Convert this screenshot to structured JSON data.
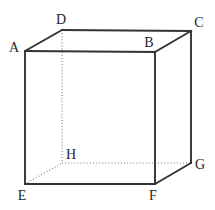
{
  "figure": {
    "name": "cube-diagram",
    "shape": "cube",
    "background_color": "#ffffff",
    "solid_edge_color": "#333333",
    "hidden_edge_color": "#7a7a7a",
    "label_color": "#262626",
    "vertices": [
      {
        "id": "A",
        "label": "A",
        "point": {
          "x": 25,
          "y": 51
        },
        "label_pos": {
          "x": 14,
          "y": 48
        },
        "hidden": false
      },
      {
        "id": "B",
        "label": "B",
        "point": {
          "x": 155,
          "y": 52
        },
        "label_pos": {
          "x": 149,
          "y": 43
        },
        "hidden": false
      },
      {
        "id": "C",
        "label": "C",
        "point": {
          "x": 191,
          "y": 31
        },
        "label_pos": {
          "x": 199,
          "y": 23
        },
        "hidden": false
      },
      {
        "id": "D",
        "label": "D",
        "point": {
          "x": 62,
          "y": 30
        },
        "label_pos": {
          "x": 61,
          "y": 20
        },
        "hidden": false
      },
      {
        "id": "E",
        "label": "E",
        "point": {
          "x": 25,
          "y": 184
        },
        "label_pos": {
          "x": 22,
          "y": 196
        },
        "hidden": false
      },
      {
        "id": "F",
        "label": "F",
        "point": {
          "x": 155,
          "y": 184
        },
        "label_pos": {
          "x": 153,
          "y": 196
        },
        "hidden": false
      },
      {
        "id": "G",
        "label": "G",
        "point": {
          "x": 191,
          "y": 163
        },
        "label_pos": {
          "x": 200,
          "y": 165
        },
        "hidden": false
      },
      {
        "id": "H",
        "label": "H",
        "point": {
          "x": 62,
          "y": 163
        },
        "label_pos": {
          "x": 71,
          "y": 155
        },
        "hidden": true
      }
    ],
    "edges_solid": [
      {
        "id": "edge-AB",
        "from": "A",
        "to": "B"
      },
      {
        "id": "edge-BC",
        "from": "B",
        "to": "C"
      },
      {
        "id": "edge-CD",
        "from": "C",
        "to": "D"
      },
      {
        "id": "edge-DA",
        "from": "D",
        "to": "A"
      },
      {
        "id": "edge-AE",
        "from": "A",
        "to": "E"
      },
      {
        "id": "edge-BF",
        "from": "B",
        "to": "F"
      },
      {
        "id": "edge-CG",
        "from": "C",
        "to": "G"
      },
      {
        "id": "edge-EF",
        "from": "E",
        "to": "F"
      },
      {
        "id": "edge-FG",
        "from": "F",
        "to": "G"
      }
    ],
    "edges_hidden": [
      {
        "id": "edge-DH",
        "from": "D",
        "to": "H"
      },
      {
        "id": "edge-EH",
        "from": "E",
        "to": "H"
      },
      {
        "id": "edge-HG",
        "from": "H",
        "to": "G"
      }
    ]
  }
}
